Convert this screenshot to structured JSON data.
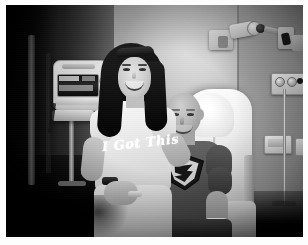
{
  "image": {
    "type": "photograph",
    "medium": "printed photo with white border",
    "color_mode": "black-and-white",
    "width_px": 308,
    "height_px": 245,
    "border": {
      "color": "#ffffff",
      "top_px": 5,
      "left_px": 6,
      "right_px": 5,
      "bottom_px": 8
    },
    "photo_area": {
      "x": 6,
      "y": 5,
      "width": 297,
      "height": 232
    }
  },
  "scene": {
    "setting": "hospital patient room",
    "description": "A woman stands beside a bald man seated in a hospital recliner bed; medical equipment is visible on the walls.",
    "subjects": [
      {
        "id": "woman",
        "position": "left-center, standing",
        "hair": "long dark hair",
        "accessory": "sunglasses pushed up on head",
        "expression": "smiling",
        "clothing": "light t-shirt with script text, light shorts",
        "jewelry": "dark wristwatch, light bracelet"
      },
      {
        "id": "man",
        "position": "center-right, seated in bed",
        "hair": "bald",
        "expression": "smiling",
        "clothing": "dark t-shirt with Superman emblem",
        "accessory": "white hospital wristband on right wrist"
      }
    ]
  },
  "text_in_image": {
    "woman_shirt": "I Got This",
    "man_shirt_emblem": "Superman shield logo"
  },
  "objects": [
    {
      "name": "iv-pump",
      "label": "IV infusion pump on rolling pole",
      "location": "left of woman"
    },
    {
      "name": "hospital-bed",
      "label": "White hospital recliner bed with pillow",
      "location": "behind man"
    },
    {
      "name": "wall-arm",
      "label": "Articulating wall-mounted equipment arm",
      "location": "upper right"
    },
    {
      "name": "gas-panel",
      "label": "Medical gas / suction wall panel with dials",
      "location": "right wall upper"
    },
    {
      "name": "wall-outlet",
      "label": "Wall outlet plates",
      "location": "right wall lower"
    },
    {
      "name": "iv-pole",
      "label": "IV pole",
      "location": "right side"
    }
  ],
  "colors": {
    "border": "#ffffff",
    "wall_light": "#c8c6c2",
    "wall_mid": "#9d9b97",
    "shadow_dark": "#0a0a0a",
    "bed_white": "#fbfaf8",
    "man_shirt": "#565452",
    "woman_shirt": "#eceae6"
  }
}
